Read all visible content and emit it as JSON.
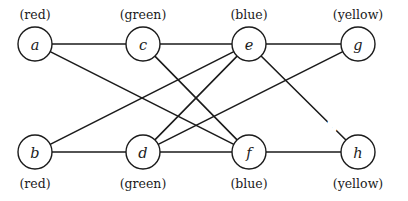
{
  "figure": {
    "title": "",
    "width": 408,
    "height": 201,
    "background_color": "#ffffff",
    "stroke_color": "#1b1b1b"
  },
  "graph_data": {
    "type": "diagram",
    "description": "Undirected weighted graph with eight labeled vertices arranged in two rows of four; each vertex carries a parenthesized color annotation.",
    "layout": "bipartite-two-rows",
    "nodes": [
      {
        "id": "a",
        "label": "a",
        "color_annotation": "(red)",
        "annotation_position": "above",
        "cx": 35,
        "cy": 44,
        "r": 17
      },
      {
        "id": "c",
        "label": "c",
        "color_annotation": "(green)",
        "annotation_position": "above",
        "cx": 143,
        "cy": 44,
        "r": 17
      },
      {
        "id": "e",
        "label": "e",
        "color_annotation": "(blue)",
        "annotation_position": "above",
        "cx": 249,
        "cy": 44,
        "r": 17
      },
      {
        "id": "g",
        "label": "g",
        "color_annotation": "(yellow)",
        "annotation_position": "above",
        "cx": 358,
        "cy": 44,
        "r": 17
      },
      {
        "id": "b",
        "label": "b",
        "color_annotation": "(red)",
        "annotation_position": "below",
        "cx": 35,
        "cy": 152,
        "r": 17
      },
      {
        "id": "d",
        "label": "d",
        "color_annotation": "(green)",
        "annotation_position": "below",
        "cx": 143,
        "cy": 152,
        "r": 17
      },
      {
        "id": "f",
        "label": "f",
        "color_annotation": "(blue)",
        "annotation_position": "below",
        "cx": 249,
        "cy": 152,
        "r": 17
      },
      {
        "id": "h",
        "label": "h",
        "color_annotation": "(yellow)",
        "annotation_position": "below",
        "cx": 358,
        "cy": 152,
        "r": 17
      }
    ],
    "edges": [
      {
        "id": "a-c",
        "source": "a",
        "target": "c",
        "weight": "1",
        "label_x": 88,
        "label_y": 32
      },
      {
        "id": "a-f",
        "source": "a",
        "target": "f",
        "weight": "2",
        "label_x": 61,
        "label_y": 72
      },
      {
        "id": "c-e",
        "source": "c",
        "target": "e",
        "weight": "7",
        "label_x": 196,
        "label_y": 32
      },
      {
        "id": "e-g",
        "source": "e",
        "target": "g",
        "weight": "9",
        "label_x": 304,
        "label_y": 32
      },
      {
        "id": "b-e",
        "source": "b",
        "target": "e",
        "weight": "6",
        "label_x": 61,
        "label_y": 126
      },
      {
        "id": "b-d",
        "source": "b",
        "target": "d",
        "weight": "4",
        "label_x": 88,
        "label_y": 164
      },
      {
        "id": "d-f",
        "source": "d",
        "target": "f",
        "weight": "3",
        "label_x": 196,
        "label_y": 164
      },
      {
        "id": "f-h",
        "source": "f",
        "target": "h",
        "weight": "10",
        "label_x": 304,
        "label_y": 164
      },
      {
        "id": "d-g",
        "source": "d",
        "target": "g",
        "weight": "5",
        "label_x": 332,
        "label_y": 76
      },
      {
        "id": "e-h",
        "source": "e",
        "target": "h",
        "weight": "8",
        "label_x": 332,
        "label_y": 126
      },
      {
        "id": "c-f",
        "source": "c",
        "target": "f",
        "weight": "",
        "label_x": 0,
        "label_y": 0
      },
      {
        "id": "d-e",
        "source": "d",
        "target": "e",
        "weight": "",
        "label_x": 0,
        "label_y": 0
      }
    ],
    "weights_listed": [
      "1",
      "2",
      "7",
      "9",
      "6",
      "4",
      "3",
      "10",
      "5",
      "8"
    ],
    "color_classes": [
      "red",
      "green",
      "blue",
      "yellow"
    ]
  }
}
